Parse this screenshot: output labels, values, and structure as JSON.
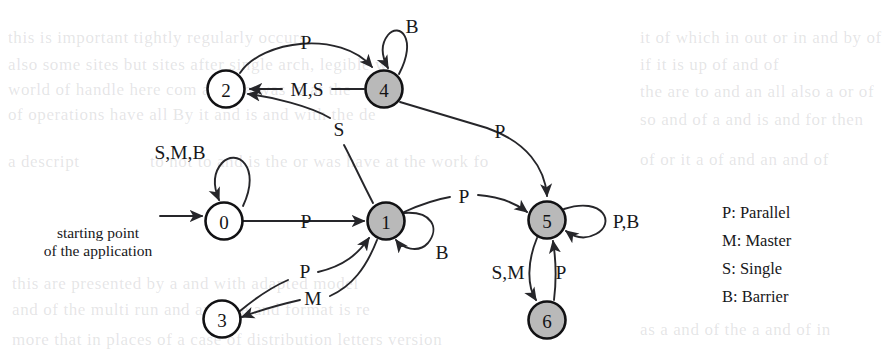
{
  "figure": {
    "type": "state-machine-diagram",
    "start_caption_line1": "starting point",
    "start_caption_line2": "of the application"
  },
  "nodes": [
    {
      "id": "0",
      "label": "0",
      "x": 224,
      "y": 221,
      "r": 18.5,
      "fill": "white"
    },
    {
      "id": "1",
      "label": "1",
      "x": 386,
      "y": 221,
      "r": 18.5,
      "fill": "gray"
    },
    {
      "id": "2",
      "label": "2",
      "x": 226,
      "y": 89,
      "r": 18.5,
      "fill": "white"
    },
    {
      "id": "3",
      "label": "3",
      "x": 222,
      "y": 319,
      "r": 18.5,
      "fill": "white"
    },
    {
      "id": "4",
      "label": "4",
      "x": 384,
      "y": 89,
      "r": 18.5,
      "fill": "gray"
    },
    {
      "id": "5",
      "label": "5",
      "x": 547,
      "y": 220,
      "r": 18.5,
      "fill": "gray"
    },
    {
      "id": "6",
      "label": "6",
      "x": 547,
      "y": 320,
      "r": 18.5,
      "fill": "gray"
    }
  ],
  "edges": [
    {
      "from": "start",
      "to": "0",
      "label": "",
      "label_x": 0,
      "label_y": 0
    },
    {
      "from": "0",
      "to": "0",
      "label": "S,M,B",
      "label_x": 180,
      "label_y": 152,
      "self_loop": true
    },
    {
      "from": "0",
      "to": "1",
      "label": "P",
      "label_x": 306,
      "label_y": 221
    },
    {
      "from": "2",
      "to": "4",
      "label": "P",
      "label_x": 306,
      "label_y": 42
    },
    {
      "from": "4",
      "to": "2",
      "label": "M,S",
      "label_x": 307,
      "label_y": 89
    },
    {
      "from": "4",
      "to": "4",
      "label": "B",
      "label_x": 412,
      "label_y": 26
    },
    {
      "from": "4",
      "to": "5",
      "label": "P",
      "label_x": 500,
      "label_y": 131
    },
    {
      "from": "1",
      "to": "2",
      "label": "S",
      "label_x": 339,
      "label_y": 129
    },
    {
      "from": "1",
      "to": "5",
      "label": "P",
      "label_x": 464,
      "label_y": 196
    },
    {
      "from": "1",
      "to": "1",
      "label": "B",
      "label_x": 442,
      "label_y": 252,
      "self_loop": true
    },
    {
      "from": "3",
      "to": "1",
      "label": "P",
      "label_x": 305,
      "label_y": 271
    },
    {
      "from": "1",
      "to": "3",
      "label": "M",
      "label_x": 313,
      "label_y": 298
    },
    {
      "from": "5",
      "to": "5",
      "label": "P,B",
      "label_x": 624,
      "label_y": 221,
      "self_loop": true
    },
    {
      "from": "5",
      "to": "6",
      "label": "S,M",
      "label_x": 508,
      "label_y": 272
    },
    {
      "from": "6",
      "to": "5",
      "label": "P",
      "label_x": 561,
      "label_y": 272
    }
  ],
  "legend": {
    "items": [
      {
        "key": "P",
        "text": "P: Parallel"
      },
      {
        "key": "M",
        "text": "M: Master"
      },
      {
        "key": "S",
        "text": "S: Single"
      },
      {
        "key": "B",
        "text": "B: Barrier"
      }
    ]
  },
  "colors": {
    "node_fill_active": "#b9b9b9",
    "node_fill_inactive": "#ffffff",
    "stroke": "#121214",
    "text": "#17171a",
    "background": "#ffffff"
  },
  "ghost_text": {
    "lines": [
      {
        "text": "this is important  tightly  regularly occurs",
        "x": 8,
        "y": 28
      },
      {
        "text": "also some  sites  but  sites  after single arch, legible w",
        "x": 8,
        "y": 55
      },
      {
        "text": "world  of  handle  here  com  all  to  a  was  to  at  the",
        "x": 8,
        "y": 80
      },
      {
        "text": "of  operations  have  all  By  it  and  is  and  with  the  de",
        "x": 8,
        "y": 105
      },
      {
        "text": "it  of  which  in  out  or  in  and  by  of",
        "x": 640,
        "y": 28
      },
      {
        "text": "if  it  is  up  of  and  of",
        "x": 640,
        "y": 55
      },
      {
        "text": "the  are  to  and  an  all  also  a  or  of",
        "x": 640,
        "y": 82
      },
      {
        "text": "so  and  of  a  and  is  and  for  then",
        "x": 640,
        "y": 110
      },
      {
        "text": "a  descript",
        "x": 8,
        "y": 152
      },
      {
        "text": "to  not  to  and  is  the  or  was  have  at  the  work  fo",
        "x": 150,
        "y": 152
      },
      {
        "text": "of  or  it  a  of  and  an  and  of",
        "x": 640,
        "y": 150
      },
      {
        "text": "as  a  and  of  the  a  and  of  in",
        "x": 640,
        "y": 320
      },
      {
        "text": "this  are  presented  by  a  and  with  adapted  model",
        "x": 12,
        "y": 274
      },
      {
        "text": "and  of  the  multi  run  and  and  the  and  format  is  re",
        "x": 12,
        "y": 300
      },
      {
        "text": "more  that  in  places  of  a  case  of  distribution  letters  version",
        "x": 12,
        "y": 330
      }
    ]
  }
}
